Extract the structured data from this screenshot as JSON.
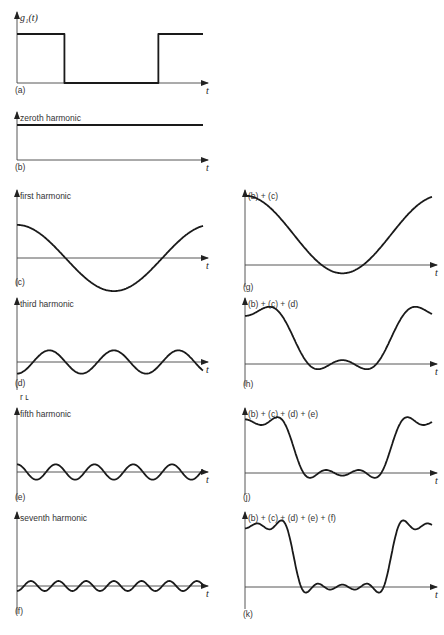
{
  "figure": {
    "time_axis_label": "t",
    "panels": [
      {
        "id": "a",
        "tag": "(a)",
        "title": "g₁(t)",
        "kind": "square",
        "col": 0,
        "y_top": 12,
        "y_base": 83,
        "y_high": 34,
        "y_tag": 93
      },
      {
        "id": "b",
        "tag": "(b)",
        "title": "zeroth harmonic",
        "kind": "harmonic",
        "n": 0,
        "col": 0,
        "y_top": 112,
        "y_base": 160,
        "y_tag": 170
      },
      {
        "id": "c",
        "tag": "(c)",
        "title": "first harmonic",
        "kind": "harmonic",
        "n": 1,
        "col": 0,
        "y_top": 190,
        "y_base": 258,
        "y_tag": 285
      },
      {
        "id": "d",
        "tag": "(d)",
        "title": "third harmonic",
        "kind": "harmonic",
        "n": 3,
        "col": 0,
        "y_top": 298,
        "y_base": 362,
        "y_tag": 386
      },
      {
        "id": "e",
        "tag": "(e)",
        "title": "fifth harmonic",
        "kind": "harmonic",
        "n": 5,
        "col": 0,
        "y_top": 408,
        "y_base": 472,
        "y_tag": 500
      },
      {
        "id": "f",
        "tag": "(f)",
        "title": "seventh harmonic",
        "kind": "harmonic",
        "n": 7,
        "col": 0,
        "y_top": 512,
        "y_base": 586,
        "y_tag": 614
      },
      {
        "id": "g",
        "tag": "(g)",
        "title": "(b) + (c)",
        "kind": "sum",
        "upto": 1,
        "col": 1,
        "y_top": 190,
        "y_base": 265,
        "y_tag": 290
      },
      {
        "id": "h",
        "tag": "(h)",
        "title": "(b) + (c) + (d)",
        "kind": "sum",
        "upto": 3,
        "col": 1,
        "y_top": 298,
        "y_base": 364,
        "y_tag": 387
      },
      {
        "id": "j",
        "tag": "(j)",
        "title": "(b) + (c) + (d) + (e)",
        "kind": "sum",
        "upto": 5,
        "col": 1,
        "y_top": 408,
        "y_base": 473,
        "y_tag": 500
      },
      {
        "id": "k",
        "tag": "(k)",
        "title": "(b) + (c) + (d) + (e) + (f)",
        "kind": "sum",
        "upto": 7,
        "col": 1,
        "y_top": 512,
        "y_base": 587,
        "y_tag": 617
      }
    ],
    "stray_marks": "r ʟ"
  },
  "chart_data": {
    "type": "line",
    "xlabel": "t",
    "ylabel": "g₁(t)",
    "series": [
      {
        "name": "(a) g₁(t) square wave",
        "description": "high for first quarter, low from 1/4 to 3/4 of period, high again to end"
      },
      {
        "name": "(b) zeroth harmonic",
        "values": "constant DC level = 1/2 of square-wave height"
      },
      {
        "name": "(c) first harmonic",
        "values": "cos(ωt) — one full period across axis, amplitude ≈ 2/π"
      },
      {
        "name": "(d) third harmonic",
        "values": "−(1/3)·cos(3ωt) scaled, 3 cycles"
      },
      {
        "name": "(e) fifth harmonic",
        "values": "(1/5)·cos(5ωt) scaled, 5 cycles"
      },
      {
        "name": "(f) seventh harmonic",
        "values": "−(1/7)·cos(7ωt) scaled, 7 cycles"
      },
      {
        "name": "(g) (b)+(c)",
        "values": "partial sum up to 1st harmonic"
      },
      {
        "name": "(h) (b)+(c)+(d)",
        "values": "partial sum up to 3rd harmonic"
      },
      {
        "name": "(j) (b)+(c)+(d)+(e)",
        "values": "partial sum up to 5th harmonic"
      },
      {
        "name": "(k) (b)+(c)+(d)+(e)+(f)",
        "values": "partial sum up to 7th harmonic"
      }
    ],
    "grid": false,
    "legend": "none"
  }
}
